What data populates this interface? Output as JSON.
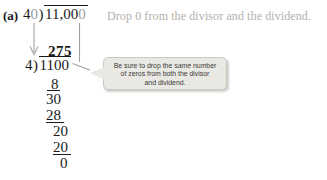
{
  "problem": {
    "part_label": "(a)",
    "original": {
      "divisor_main": "4",
      "divisor_dropped_zero": "0",
      "dividend_main": "11,00",
      "dividend_dropped_zero": "0"
    },
    "annotation": "Drop 0 from the divisor and the dividend.",
    "simplified": {
      "quotient": "275",
      "divisor": "4",
      "dividend": "1100",
      "steps": [
        "8",
        "30",
        "28",
        "20",
        "20",
        "0"
      ]
    },
    "callout": {
      "line1_prefix": "Be sure to drop the ",
      "line1_italic": "same",
      "line1_suffix": " number",
      "line2": "of zeros from both the divisor",
      "line3": "and dividend."
    }
  },
  "notation": {
    "close_paren": ")"
  },
  "colors": {
    "ink": "#1a1a1a",
    "dropped_zero": "#9b9b9b",
    "annotation_text": "#b3b0ab",
    "callout_bg": "#e9e8e3",
    "callout_border": "#c9c8c3",
    "callout_text": "#3a3a3a",
    "arrow": "#a2a09c"
  }
}
